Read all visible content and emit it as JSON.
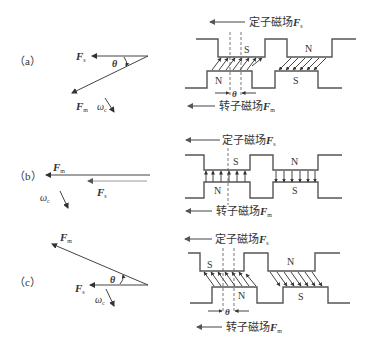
{
  "figure": {
    "panels": [
      {
        "id": "a",
        "label": "（a）",
        "phasor": {
          "stator_vector": "F",
          "stator_sub": "s",
          "rotor_vector": "F",
          "rotor_sub": "m",
          "angle": "θ",
          "speed": "ω",
          "speed_sub": "c",
          "relation": "rotor lags stator by θ (generating)"
        },
        "gap": {
          "stator_field_label": "定子磁场",
          "stator_field_vec": "F",
          "stator_field_sub": "s",
          "rotor_field_label": "转子磁场",
          "rotor_field_vec": "F",
          "rotor_field_sub": "m",
          "poles_stator": [
            "S",
            "N"
          ],
          "poles_rotor": [
            "N",
            "S"
          ],
          "angle": "θ"
        }
      },
      {
        "id": "b",
        "label": "（b）",
        "phasor": {
          "stator_vector": "F",
          "stator_sub": "s",
          "rotor_vector": "F",
          "rotor_sub": "m",
          "speed": "ω",
          "speed_sub": "c",
          "relation": "aligned (θ = 0)"
        },
        "gap": {
          "stator_field_label": "定子磁场",
          "stator_field_vec": "F",
          "stator_field_sub": "s",
          "rotor_field_label": "转子磁场",
          "rotor_field_vec": "F",
          "rotor_field_sub": "m",
          "poles_stator": [
            "S",
            "N"
          ],
          "poles_rotor": [
            "N",
            "S"
          ]
        }
      },
      {
        "id": "c",
        "label": "（c）",
        "phasor": {
          "stator_vector": "F",
          "stator_sub": "s",
          "rotor_vector": "F",
          "rotor_sub": "m",
          "angle": "θ",
          "speed": "ω",
          "speed_sub": "c",
          "relation": "rotor leads stator by θ (motoring)"
        },
        "gap": {
          "stator_field_label": "定子磁场",
          "stator_field_vec": "F",
          "stator_field_sub": "s",
          "rotor_field_label": "转子磁场",
          "rotor_field_vec": "F",
          "rotor_field_sub": "m",
          "poles_stator": [
            "S",
            "N"
          ],
          "poles_rotor": [
            "N",
            "S"
          ],
          "angle": "θ"
        }
      }
    ]
  }
}
